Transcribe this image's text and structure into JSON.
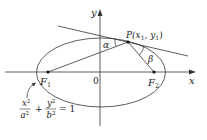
{
  "diagram": {
    "axes": {
      "x_label": "x",
      "y_label": "y",
      "origin_label": "0"
    },
    "foci": {
      "f1_main": "F",
      "f1_sub": "1",
      "f2_main": "F",
      "f2_sub": "2"
    },
    "point": {
      "p_main": "P(x",
      "p_sub1": "1",
      "p_mid": ", y",
      "p_sub2": "1",
      "p_end": ")"
    },
    "angles": {
      "alpha": "α",
      "beta": "β"
    },
    "equation": {
      "x_num": "x",
      "x_num_exp": "2",
      "x_den": "a",
      "x_den_exp": "2",
      "plus": "+",
      "y_num": "y",
      "y_num_exp": "2",
      "y_den": "b",
      "y_den_exp": "2",
      "equals": "= 1"
    },
    "colors": {
      "stroke": "#333333",
      "background": "#ffffff"
    }
  }
}
